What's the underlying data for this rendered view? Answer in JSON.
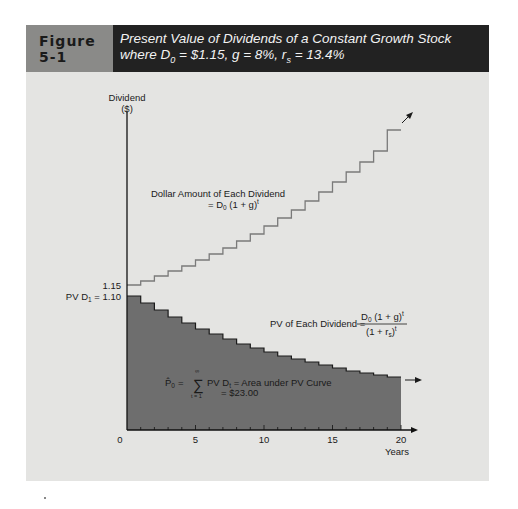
{
  "figure": {
    "label": "Figure 5-1",
    "title_line1": "Present Value of Dividends of a Constant Growth Stock",
    "title_line2_prefix": "where D",
    "title_line2_sub0": "0",
    "title_line2_mid": " = $1.15, g = 8%, r",
    "title_line2_subs": "s",
    "title_line2_suffix": " = 13.4%"
  },
  "colors": {
    "panel_bg": "#e4e4e2",
    "header_label_bg": "#8a8a88",
    "header_title_bg": "#222222",
    "dividend_line": "#7a7a7a",
    "pv_fill": "#6e6e6e",
    "pv_line": "#1a1a1a",
    "axis": "#111111"
  },
  "annotations": {
    "y_axis_label_1": "Dividend",
    "y_axis_label_2": "($)",
    "y_tick_115": "1.15",
    "pv_d1_label": "PV D",
    "pv_d1_sub": "1",
    "pv_d1_value": " = 1.10",
    "dividend_curve_label_1": "Dollar Amount of Each Dividend",
    "dividend_curve_label_2": "= D",
    "dividend_curve_label_2_sub": "0",
    "dividend_curve_label_2_rest": " (1 + g)",
    "dividend_curve_label_2_sup": "t",
    "pv_curve_label": "PV of Each Dividend  =",
    "pv_frac_num": "D",
    "pv_frac_num_sub": "0",
    "pv_frac_num_rest": " (1 + g)",
    "pv_frac_num_sup": "t",
    "pv_frac_den": "(1 + r",
    "pv_frac_den_sub": "s",
    "pv_frac_den_rest": ")",
    "pv_frac_den_sup": "t",
    "sum_lhs": "P̂",
    "sum_lhs_sub": "0",
    "sum_eq": "=",
    "sum_symbol": "∑",
    "sum_upper": "∞",
    "sum_lower": "t = 1",
    "sum_rhs": "PV D",
    "sum_rhs_sub": "t",
    "sum_rhs_rest": " = Area under PV Curve",
    "sum_value": "= $23.00",
    "x_axis_title": "Years"
  },
  "chart_data": {
    "type": "area",
    "title": "Present Value of Dividends of a Constant Growth Stock where D0 = $1.15, g = 8%, rs = 13.4%",
    "xlabel": "Years",
    "ylabel": "Dividend ($)",
    "x_ticks": [
      0,
      5,
      10,
      15,
      20
    ],
    "xlim": [
      0,
      20
    ],
    "grid": false,
    "legend": "none (inline labels)",
    "x": [
      1,
      2,
      3,
      4,
      5,
      6,
      7,
      8,
      9,
      10,
      11,
      12,
      13,
      14,
      15,
      16,
      17,
      18,
      19,
      20
    ],
    "series": [
      {
        "name": "Dollar Amount of Each Dividend = D0(1+g)^t",
        "style": "step line",
        "values": [
          1.24,
          1.34,
          1.45,
          1.56,
          1.69,
          1.82,
          1.97,
          2.13,
          2.3,
          2.48,
          2.68,
          2.9,
          3.13,
          3.38,
          3.65,
          3.94,
          4.25,
          4.59,
          4.96,
          5.36
        ]
      },
      {
        "name": "PV of Each Dividend = D0(1+g)^t/(1+rs)^t",
        "style": "filled step area",
        "values": [
          1.1,
          1.04,
          0.99,
          0.95,
          0.9,
          0.86,
          0.82,
          0.78,
          0.74,
          0.7,
          0.67,
          0.64,
          0.61,
          0.58,
          0.55,
          0.52,
          0.5,
          0.48,
          0.45,
          0.43
        ]
      }
    ],
    "annotations": [
      "1.15 (D0 level on y-axis)",
      "PV D1 = 1.10",
      "P0 = Σ(t=1..∞) PV Dt = Area under PV Curve = $23.00"
    ],
    "pixel_y_dividend": [
      285,
      281,
      276,
      271,
      266,
      260,
      254,
      248,
      241,
      234,
      226,
      218,
      210,
      201,
      192,
      182,
      172,
      162,
      151,
      130
    ],
    "pixel_y_pv": [
      296,
      303,
      310,
      317,
      323,
      329,
      334,
      339,
      344,
      348,
      352,
      356,
      359,
      362,
      365,
      368,
      371,
      373,
      375,
      377
    ]
  },
  "axes": {
    "origin_x": 127,
    "origin_y": 430,
    "px_per_year": 13.7,
    "y_top": 112,
    "x_end": 413,
    "x_tick_labels": [
      "0",
      "5",
      "10",
      "15",
      "20"
    ]
  }
}
